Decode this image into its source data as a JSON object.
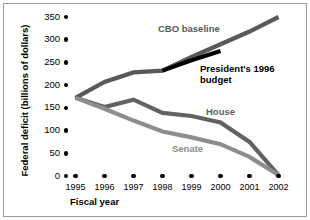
{
  "chart_data": {
    "type": "line",
    "title": "",
    "xlabel": "Fiscal year",
    "ylabel": "Federal deficit (billions of dollars)",
    "categories": [
      1995,
      1996,
      1997,
      1998,
      1999,
      2000,
      2001,
      2002
    ],
    "xtick_labels": [
      "1995",
      "1996",
      "1997",
      "1998",
      "1999",
      "2000",
      "2001",
      "2002"
    ],
    "ytick_labels": [
      "0",
      "50",
      "100",
      "150",
      "200",
      "250",
      "300",
      "350"
    ],
    "ytick_values": [
      0,
      50,
      100,
      150,
      200,
      250,
      300,
      350
    ],
    "ylim": [
      0,
      350
    ],
    "xlim": [
      1995,
      2002
    ],
    "grid": false,
    "legend": "inline-annotations",
    "series": [
      {
        "name": "CBO baseline",
        "color": "#595959",
        "x": [
          1995,
          1996,
          1997,
          1998,
          1999,
          2000,
          2001,
          2002
        ],
        "values": [
          172,
          207,
          228,
          232,
          262,
          290,
          318,
          350
        ]
      },
      {
        "name": "President's 1996 budget",
        "color": "#000000",
        "x": [
          1998,
          1999,
          2000
        ],
        "values": [
          232,
          255,
          275
        ]
      },
      {
        "name": "House",
        "color": "#626262",
        "x": [
          1995,
          1996,
          1997,
          1998,
          1999,
          2000,
          2001,
          2002
        ],
        "values": [
          172,
          152,
          168,
          139,
          132,
          118,
          75,
          2
        ]
      },
      {
        "name": "Senate",
        "color": "#8d8d8d",
        "x": [
          1995,
          1996,
          1997,
          1998,
          1999,
          2000,
          2001,
          2002
        ],
        "values": [
          172,
          148,
          122,
          98,
          85,
          70,
          42,
          2
        ]
      }
    ],
    "annotations": [
      {
        "text": "CBO baseline",
        "series": "CBO baseline"
      },
      {
        "text": "President's 1996\nbudget",
        "series": "President's 1996 budget"
      },
      {
        "text": "House",
        "series": "House"
      },
      {
        "text": "Senate",
        "series": "Senate"
      }
    ]
  }
}
